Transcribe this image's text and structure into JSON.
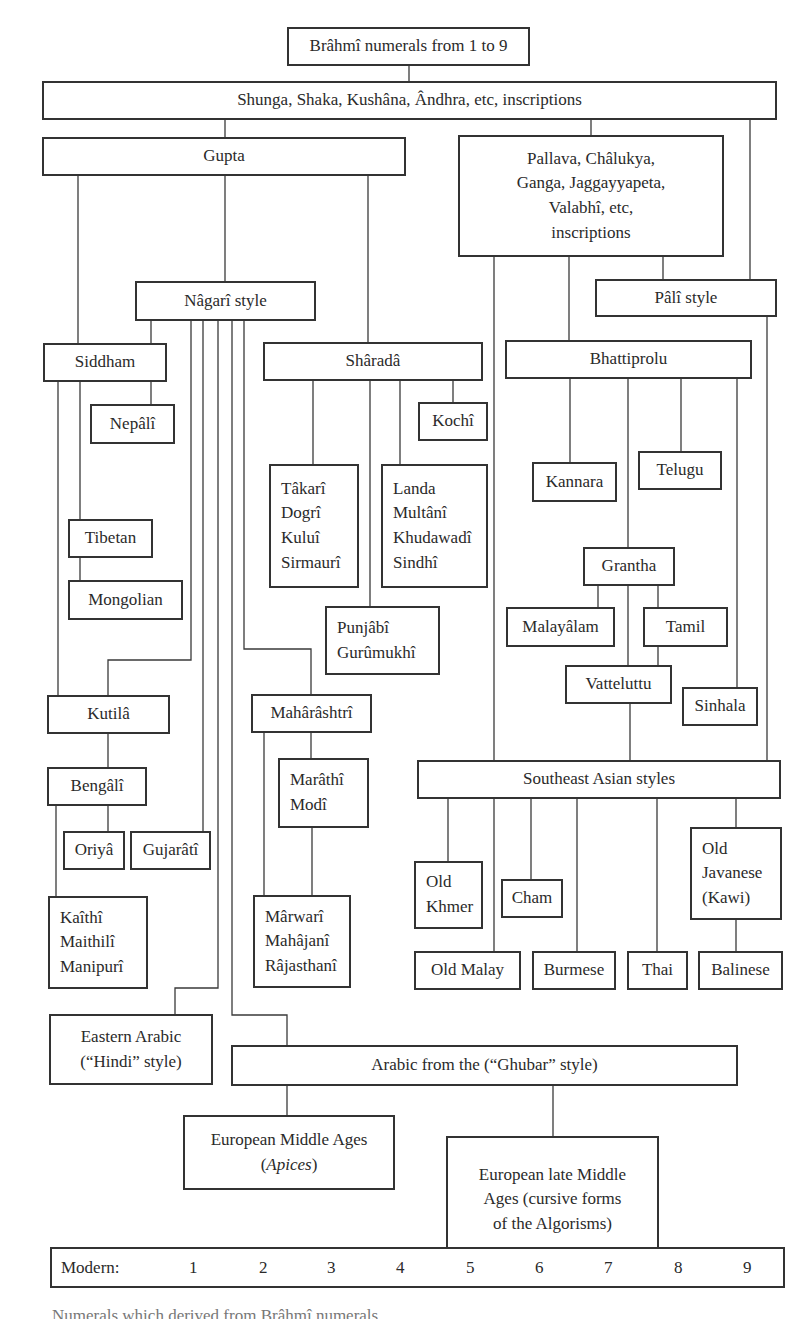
{
  "diagram": {
    "title_node": "Brâhmî numerals from 1 to 9",
    "nodes": {
      "brahmi": "Brâhmî numerals from 1 to 9",
      "shunga": "Shunga, Shaka, Kushâna, Ândhra, etc, inscriptions",
      "gupta": "Gupta",
      "pallava": [
        "Pallava, Châlukya,",
        "Ganga, Jaggayyapeta,",
        "Valabhî, etc,",
        "inscriptions"
      ],
      "nagari": "Nâgarî style",
      "pali": "Pâlî style",
      "siddham": "Siddham",
      "nepali": "Nepâlî",
      "sharada": "Shâradâ",
      "kochi": "Kochî",
      "bhattiprolu": "Bhattiprolu",
      "takari": [
        "Tâkarî",
        "Dogrî",
        "Kuluî",
        "Sirmaurî"
      ],
      "landa": [
        "Landa",
        "Multânî",
        "Khudawadî",
        "Sindhî"
      ],
      "kannara": "Kannara",
      "telugu": "Telugu",
      "tibetan": "Tibetan",
      "mongolian": "Mongolian",
      "grantha": "Grantha",
      "punjabi": [
        "Punjâbî",
        "Gurûmukhî"
      ],
      "malayalam": "Malayâlam",
      "tamil": "Tamil",
      "vatteluttu": "Vatteluttu",
      "sinhala": "Sinhala",
      "kutila": "Kutilâ",
      "maharashtri": "Mahârâshtrî",
      "bengali": "Bengâlî",
      "marathi": [
        "Marâthî",
        "Modî"
      ],
      "southeast_asian": "Southeast Asian styles",
      "oriya": "Oriyâ",
      "gujarati": "Gujarâtî",
      "old_khmer": [
        "Old",
        "Khmer"
      ],
      "cham": "Cham",
      "old_javanese": [
        "Old",
        "Javanese",
        "(Kawi)"
      ],
      "kaithi": [
        "Kaîthî",
        "Maithilî",
        "Manipurî"
      ],
      "marwari": [
        "Mârwarî",
        "Mahâjanî",
        "Râjasthanî"
      ],
      "old_malay": "Old Malay",
      "burmese": "Burmese",
      "thai": "Thai",
      "balinese": "Balinese",
      "eastern_arabic": [
        "Eastern Arabic",
        "(“Hindi” style)"
      ],
      "ghubar": "Arabic from the (“Ghubar” style)",
      "european_ma": [
        "European Middle Ages",
        "Apices"
      ],
      "european_late": [
        "European late Middle",
        "Ages (cursive forms",
        "of the Algorisms)"
      ]
    },
    "modern_row": {
      "label": "Modern:",
      "digits": [
        "1",
        "2",
        "3",
        "4",
        "5",
        "6",
        "7",
        "8",
        "9"
      ]
    },
    "caption_partial": "Numerals which derived from Brâhmî numerals",
    "colors": {
      "stroke": "#333333",
      "background": "#ffffff",
      "text": "#2a2a2a"
    }
  }
}
